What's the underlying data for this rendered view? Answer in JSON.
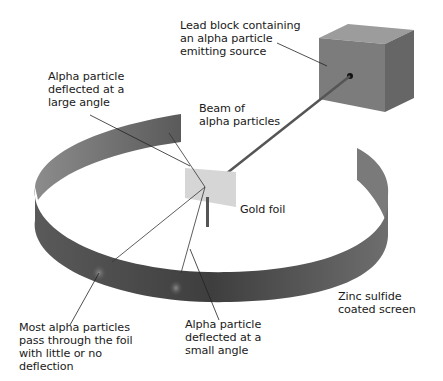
{
  "labels": {
    "lead_block": "Lead block containing\nan alpha particle\nemitting source",
    "large_angle": "Alpha particle\ndeflected at a\nlarge angle",
    "beam": "Beam of\nalpha particles",
    "gold_foil": "Gold foil",
    "zinc_screen": "Zinc sulfide\ncoated screen",
    "most_pass": "Most alpha particles\npass through the foil\nwith little or no\ndeflection",
    "small_angle": "Alpha particle\ndeflected at a\nsmall angle"
  },
  "colors": {
    "screen_dark": "#4a4a4a",
    "screen_light": "#8a8a8a",
    "block_front": "#7a7a7a",
    "block_top": "#9a9a9a",
    "block_side": "#6a6a6a",
    "foil": "#d8d8d8",
    "line": "#333333"
  }
}
